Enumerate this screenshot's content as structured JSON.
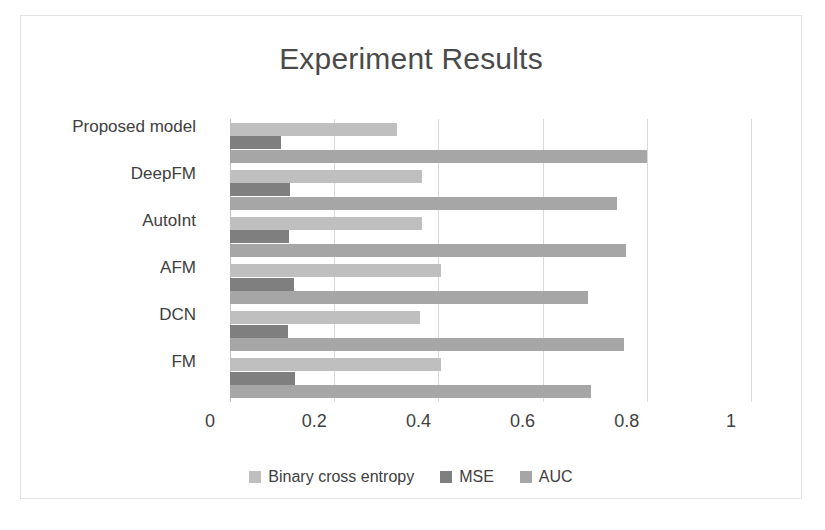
{
  "chart_data": {
    "type": "bar",
    "orientation": "horizontal",
    "title": "Experiment Results",
    "xlabel": "",
    "ylabel": "",
    "xlim": [
      0,
      1
    ],
    "grid": true,
    "legend_position": "bottom",
    "categories": [
      "FM",
      "DCN",
      "AFM",
      "AutoInt",
      "DeepFM",
      "Proposed model"
    ],
    "categories_top_to_bottom": [
      "Proposed model",
      "DeepFM",
      "AutoInt",
      "AFM",
      "DCN",
      "FM"
    ],
    "tick_labels": [
      "0",
      "0.2",
      "0.4",
      "0.6",
      "0.8",
      "1"
    ],
    "tick_values": [
      0,
      0.2,
      0.4,
      0.6,
      0.8,
      1
    ],
    "series": [
      {
        "name": "Binary cross entropy",
        "color": "#bfbfbf",
        "values": [
          0.405,
          0.365,
          0.405,
          0.368,
          0.368,
          0.321
        ]
      },
      {
        "name": "MSE",
        "color": "#7f7f7f",
        "values": [
          0.125,
          0.112,
          0.123,
          0.113,
          0.115,
          0.098
        ]
      },
      {
        "name": "AUC",
        "color": "#a6a6a6",
        "values": [
          0.693,
          0.757,
          0.687,
          0.76,
          0.743,
          0.8
        ]
      }
    ]
  }
}
